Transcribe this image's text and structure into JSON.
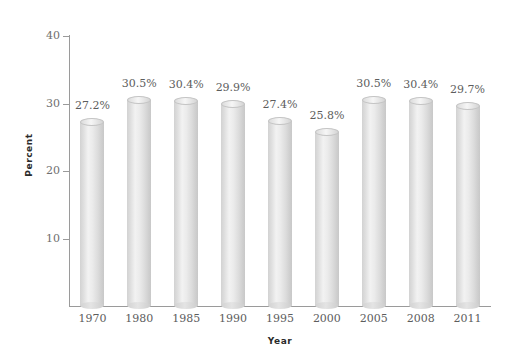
{
  "chart_data": {
    "type": "bar",
    "title": "",
    "subtitle": "",
    "xlabel": "Year",
    "ylabel": "Percent",
    "categories": [
      "1970",
      "1980",
      "1985",
      "1990",
      "1995",
      "2000",
      "2005",
      "2008",
      "2011"
    ],
    "values": [
      27.2,
      30.5,
      30.4,
      29.9,
      27.4,
      25.8,
      30.5,
      30.4,
      29.7
    ],
    "data_labels": [
      "27.2%",
      "30.5%",
      "30.4%",
      "29.9%",
      "27.4%",
      "25.8%",
      "30.5%",
      "30.4%",
      "29.7%"
    ],
    "ylim": [
      0,
      40
    ],
    "xlim": null,
    "yticks": [
      10,
      20,
      30,
      40
    ],
    "ytick_labels": [
      "10",
      "20",
      "30",
      "40"
    ],
    "grid": false,
    "legend": null,
    "legend_position": "none",
    "series": [
      {
        "name": "Percent",
        "values": [
          27.2,
          30.5,
          30.4,
          29.9,
          27.4,
          25.8,
          30.5,
          30.4,
          29.7
        ]
      }
    ],
    "style": {
      "bar_shape": "cylinder",
      "bar_fill": "#e4e4e4",
      "bar_edge": "#c4c4c4",
      "axis_color": "#9a9a9a",
      "label_color": "#5d5d5d",
      "axis_title_color": "#2b2b2b",
      "background": "#ffffff"
    }
  }
}
